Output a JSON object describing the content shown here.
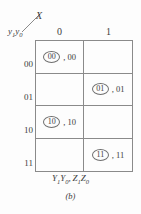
{
  "figure": {
    "label": "(b)",
    "caption_plain": "Y1Y0, Z1Z0",
    "caption_parts": {
      "y1": "Y",
      "y1sub": "1",
      "y0": "Y",
      "y0sub": "0",
      "sep": ",",
      "z1": "Z",
      "z1sub": "1",
      "z0": "Z",
      "z0sub": "0"
    }
  },
  "header": {
    "column_variable": "X",
    "row_variable_plain": "y1y0",
    "row_variable_parts": {
      "y1": "y",
      "y1sub": "1",
      "y0": "y",
      "y0sub": "0"
    }
  },
  "table": {
    "column_headers": [
      "0",
      "1"
    ],
    "row_headers": [
      "00",
      "01",
      "10",
      "11"
    ],
    "cells": [
      [
        {
          "circled": "00",
          "output": ", 00",
          "filled": true
        },
        {
          "circled": "",
          "output": "",
          "filled": false
        }
      ],
      [
        {
          "circled": "",
          "output": "",
          "filled": false
        },
        {
          "circled": "01",
          "output": ", 01",
          "filled": true
        }
      ],
      [
        {
          "circled": "10",
          "output": ", 10",
          "filled": true
        },
        {
          "circled": "",
          "output": "",
          "filled": false
        }
      ],
      [
        {
          "circled": "",
          "output": "",
          "filled": false
        },
        {
          "circled": "11",
          "output": ", 11",
          "filled": true
        }
      ]
    ]
  },
  "colors": {
    "line": "#8a8a8a",
    "text": "#3c3c3c",
    "background": "#fdfdfd"
  }
}
